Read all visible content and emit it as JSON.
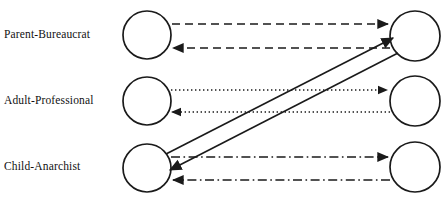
{
  "diagram": {
    "background_color": "#ffffff",
    "stroke_color": "#1a1a1a",
    "rows": [
      {
        "id": "parent-bureaucrat",
        "label": "Parent-Bureaucrat",
        "line_style": "dashed",
        "left_node": {
          "cx": 147,
          "cy": 35,
          "r": 24
        },
        "right_node": {
          "cx": 415,
          "cy": 36,
          "r": 25
        },
        "edges": [
          {
            "direction": "left-to-right",
            "y": 24,
            "style": "dashed",
            "arrow": "right"
          },
          {
            "direction": "right-to-left",
            "y": 48,
            "style": "dashed",
            "arrow": "left"
          }
        ]
      },
      {
        "id": "adult-professional",
        "label": "Adult-Professional",
        "line_style": "dotted",
        "left_node": {
          "cx": 147,
          "cy": 101,
          "r": 24
        },
        "right_node": {
          "cx": 415,
          "cy": 101,
          "r": 25
        },
        "edges": [
          {
            "direction": "left-to-right",
            "y": 90,
            "style": "dotted",
            "arrow": "right"
          },
          {
            "direction": "right-to-left",
            "y": 112,
            "style": "dotted",
            "arrow": "left"
          }
        ]
      },
      {
        "id": "child-anarchist",
        "label": "Child-Anarchist",
        "line_style": "dash-dot",
        "left_node": {
          "cx": 147,
          "cy": 168,
          "r": 24
        },
        "right_node": {
          "cx": 415,
          "cy": 167,
          "r": 25
        },
        "edges": [
          {
            "direction": "left-to-right",
            "y": 157,
            "style": "dash-dot",
            "arrow": "right"
          },
          {
            "direction": "right-to-left",
            "y": 180,
            "style": "dash-dot",
            "arrow": "left"
          }
        ]
      }
    ],
    "crossed_edges": [
      {
        "id": "child-to-parent",
        "label": "Child-Anarchist to Parent-Bureaucrat",
        "style": "solid",
        "arrow": "end",
        "from": {
          "x": 166,
          "y": 154
        },
        "to": {
          "x": 393,
          "y": 38
        }
      },
      {
        "id": "parent-to-child",
        "label": "Parent-Bureaucrat to Child-Anarchist",
        "style": "solid",
        "arrow": "end",
        "from": {
          "x": 398,
          "y": 53
        },
        "to": {
          "x": 170,
          "y": 170
        }
      }
    ],
    "line_styles": {
      "dashed": "8,5",
      "dotted": "1.4,2.6",
      "dash-dot": "9,3.5,1.6,3.5",
      "solid": "none"
    }
  }
}
